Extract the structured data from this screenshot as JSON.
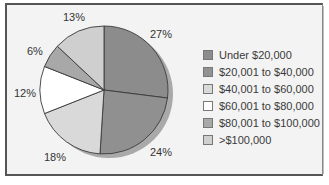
{
  "chart_data": {
    "type": "pie",
    "title": "",
    "categories": [
      "Under $20,000",
      "$20,001 to $40,000",
      "$40,001 to $60,000",
      "$60,001 to $80,000",
      "$80,001 to $100,000",
      ">$100,000"
    ],
    "values": [
      27,
      24,
      18,
      12,
      6,
      13
    ],
    "unit": "%",
    "labels": [
      "27%",
      "24%",
      "18%",
      "12%",
      "6%",
      "13%"
    ],
    "colors": [
      "#8c8c8c",
      "#909090",
      "#d9d9d9",
      "#ffffff",
      "#a8a8a8",
      "#cfcfcf"
    ],
    "start_angle": "12 o'clock, clockwise",
    "legend_position": "right",
    "shadow": true
  },
  "legend": {
    "items": [
      {
        "label": "Under $20,000",
        "color": "#8c8c8c"
      },
      {
        "label": "$20,001 to $40,000",
        "color": "#929292"
      },
      {
        "label": "$40,001 to $60,000",
        "color": "#d9d9d9"
      },
      {
        "label": "$60,001 to $80,000",
        "color": "#ffffff"
      },
      {
        "label": "$80,001 to $100,000",
        "color": "#a8a8a8"
      },
      {
        "label": ">$100,000",
        "color": "#cfcfcf"
      }
    ]
  },
  "slice_labels": [
    {
      "text": "27%",
      "x": 150,
      "y": 28
    },
    {
      "text": "24%",
      "x": 150,
      "y": 146
    },
    {
      "text": "18%",
      "x": 44,
      "y": 151
    },
    {
      "text": "12%",
      "x": 14,
      "y": 87
    },
    {
      "text": "6%",
      "x": 27,
      "y": 45
    },
    {
      "text": "13%",
      "x": 63,
      "y": 11
    }
  ]
}
